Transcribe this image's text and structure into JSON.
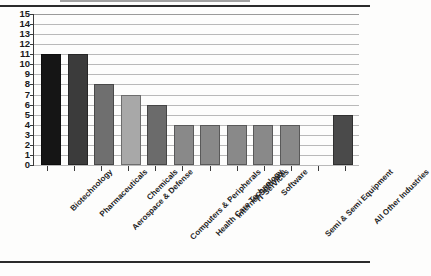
{
  "document": {
    "has_top_rule": true,
    "has_bottom_rule": true
  },
  "chart_data": {
    "type": "bar",
    "title": "",
    "subtitle": "",
    "xlabel": "",
    "ylabel": "",
    "ylim": [
      0,
      15
    ],
    "ytick_step": 1,
    "grid": true,
    "legend": "none",
    "orientation": "vertical",
    "xtick_label_rotation": -45,
    "categories": [
      "Biotechnology",
      "Pharmaceuticals",
      "Aerospace & Defense",
      "Chemicals",
      "Computers & Peripherals",
      "Health Care Technology",
      "Internet Software",
      "IT Services",
      "Software",
      "Semi & Semi Equipment",
      "",
      "All Other Industries"
    ],
    "values": [
      11,
      11,
      8,
      7,
      6,
      4,
      4,
      4,
      4,
      4,
      null,
      5
    ],
    "bar_colors": [
      "#151515",
      "#3b3b3b",
      "#6f6f6f",
      "#a8a8a8",
      "#6b6b6b",
      "#898989",
      "#898989",
      "#898989",
      "#898989",
      "#898989",
      "#ffffff",
      "#4a4a4a"
    ],
    "yticks": [
      "15",
      "14",
      "13",
      "12",
      "11",
      "10",
      "9",
      "8",
      "7",
      "6",
      "5",
      "4",
      "3",
      "2",
      "1",
      "0"
    ]
  },
  "style": {
    "axis_color": "#3a3a3a",
    "grid_color": "#b9b9b9",
    "text_color": "#1a1a1a",
    "background": "#fdfdfc"
  }
}
